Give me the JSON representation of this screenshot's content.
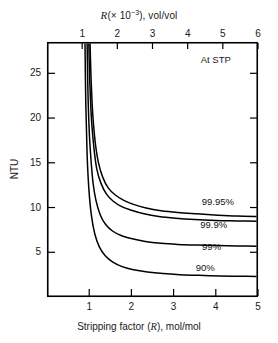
{
  "figure": {
    "background_color": "#ffffff",
    "line_color": "#000000",
    "frame": {
      "left_px": 47,
      "right_px": 258,
      "top_px": 42,
      "bottom_px": 297
    }
  },
  "top_axis": {
    "title_prefix": "R",
    "title_paren_open": "(× 10",
    "title_exponent": "−3",
    "title_suffix": "), vol/vol",
    "ticks": [
      "1",
      "2",
      "3",
      "4",
      "5",
      "6"
    ]
  },
  "bottom_axis": {
    "title_prefix": "Stripping factor (",
    "title_symbol": "R",
    "title_suffix": "), mol/mol",
    "ticks": [
      "1",
      "2",
      "3",
      "4",
      "5"
    ]
  },
  "y_axis": {
    "title": "NTU",
    "ticks": [
      "25",
      "20",
      "15",
      "10",
      "5"
    ]
  },
  "annotations": {
    "stp": "At STP"
  },
  "curve_labels": [
    "99.95%",
    "99.9%",
    "99%",
    "90%"
  ],
  "chart_data": {
    "type": "line",
    "title": "",
    "xlabel": "Stripping factor (R), mol/mol",
    "ylabel": "NTU",
    "x2label": "R(× 10−3), vol/vol",
    "xlim": [
      0.0,
      5.0
    ],
    "x2lim": [
      0.0,
      6.0
    ],
    "ylim": [
      0,
      28.5
    ],
    "grid": false,
    "legend": "inline-curve-labels",
    "annotations": [
      {
        "text": "At STP",
        "x": 4.0,
        "y": 26.5
      }
    ],
    "xticks": [
      1,
      2,
      3,
      4,
      5
    ],
    "x2ticks": [
      1,
      2,
      3,
      4,
      5,
      6
    ],
    "yticks": [
      5,
      10,
      15,
      20,
      25
    ],
    "series": [
      {
        "name": "99.95%",
        "label_x": 4.05,
        "label_y": 10.6,
        "asymptote_x": 1.0,
        "x": [
          1.02,
          1.04,
          1.07,
          1.1,
          1.15,
          1.22,
          1.32,
          1.45,
          1.62,
          1.82,
          2.05,
          2.35,
          2.7,
          3.1,
          3.55,
          4.05,
          4.5,
          5.0
        ],
        "y": [
          28.5,
          25.0,
          21.6,
          19.4,
          17.0,
          15.0,
          13.4,
          12.2,
          11.4,
          10.8,
          10.35,
          9.95,
          9.65,
          9.45,
          9.3,
          9.15,
          9.05,
          9.0
        ]
      },
      {
        "name": "99.9%",
        "label_x": 3.95,
        "label_y": 8.0,
        "asymptote_x": 0.97,
        "x": [
          0.99,
          1.01,
          1.04,
          1.07,
          1.12,
          1.18,
          1.28,
          1.41,
          1.57,
          1.77,
          2.0,
          2.3,
          2.65,
          3.05,
          3.5,
          4.0,
          4.5,
          5.0
        ],
        "y": [
          28.5,
          24.6,
          21.0,
          18.8,
          16.3,
          14.3,
          12.7,
          11.5,
          10.7,
          10.1,
          9.7,
          9.3,
          9.0,
          8.8,
          8.65,
          8.55,
          8.5,
          8.45
        ]
      },
      {
        "name": "99%",
        "label_x": 3.9,
        "label_y": 5.6,
        "asymptote_x": 0.93,
        "x": [
          0.95,
          0.97,
          1.0,
          1.04,
          1.09,
          1.16,
          1.26,
          1.39,
          1.56,
          1.77,
          2.02,
          2.33,
          2.7,
          3.1,
          3.55,
          4.05,
          4.5,
          5.0
        ],
        "y": [
          28.5,
          23.0,
          18.6,
          15.5,
          12.8,
          10.8,
          9.2,
          8.1,
          7.35,
          6.85,
          6.5,
          6.2,
          6.0,
          5.88,
          5.8,
          5.75,
          5.7,
          5.68
        ]
      },
      {
        "name": "90%",
        "label_x": 3.75,
        "label_y": 3.2,
        "asymptote_x": 0.88,
        "x": [
          0.9,
          0.92,
          0.95,
          0.99,
          1.05,
          1.13,
          1.24,
          1.38,
          1.56,
          1.78,
          2.05,
          2.38,
          2.75,
          3.15,
          3.6,
          4.1,
          4.55,
          5.0
        ],
        "y": [
          28.5,
          21.5,
          16.0,
          12.2,
          9.2,
          7.1,
          5.6,
          4.6,
          3.9,
          3.4,
          3.05,
          2.8,
          2.62,
          2.5,
          2.42,
          2.36,
          2.32,
          2.3
        ]
      }
    ]
  }
}
